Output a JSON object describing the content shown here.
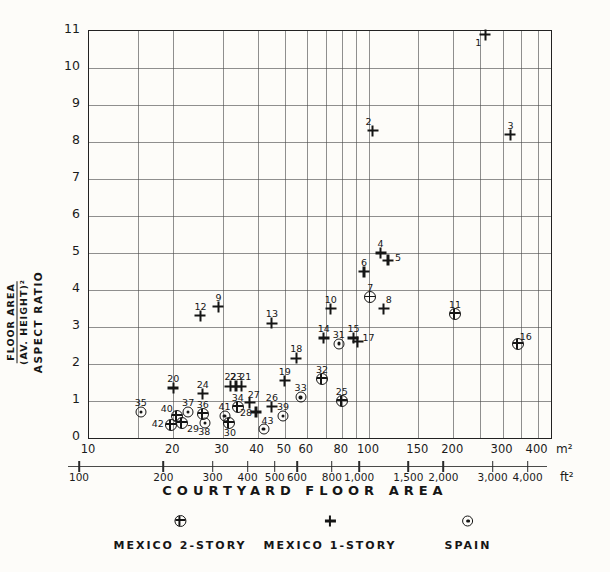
{
  "figure": {
    "paper_color": "#fdfcf9",
    "ink_color": "#1d1d1d"
  },
  "chart_data": {
    "type": "scatter",
    "title": "",
    "x_axis": {
      "label": "COURTYARD FLOOR AREA",
      "scale": "log",
      "unit_primary": "m²",
      "unit_secondary": "ft²",
      "ticks_m2": [
        10,
        20,
        30,
        40,
        50,
        60,
        80,
        100,
        150,
        200,
        300,
        400
      ],
      "tick_labels_m2": [
        "10",
        "20",
        "30",
        "40",
        "50",
        "60",
        "80",
        "100",
        "150",
        "200",
        "300",
        "400"
      ],
      "ticks_ft2": [
        100,
        200,
        300,
        400,
        500,
        600,
        800,
        1000,
        1500,
        2000,
        3000,
        4000
      ],
      "tick_labels_ft2": [
        "100",
        "200",
        "300",
        "400",
        "500",
        "600",
        "800",
        "1,000",
        "1,500",
        "2,000",
        "3,000",
        "4,000"
      ],
      "gridlines_m2": [
        15,
        20,
        30,
        40,
        50,
        60,
        70,
        80,
        90,
        100,
        150,
        200,
        250,
        300,
        350,
        400
      ],
      "xlim_m2": [
        10,
        450
      ]
    },
    "y_axis": {
      "label_lines": [
        "FLOOR AREA",
        "(AV. HEIGHT)²",
        "ASPECT RATIO"
      ],
      "ticks": [
        0,
        1,
        2,
        3,
        4,
        5,
        6,
        7,
        8,
        9,
        10,
        11
      ],
      "ylim": [
        0,
        11
      ],
      "grid": true
    },
    "series": [
      {
        "name": "MEXICO 2-STORY",
        "symbol": "circle-cross",
        "points": [
          {
            "n": "7",
            "m2": 101,
            "ratio": 3.8
          },
          {
            "n": "11",
            "m2": 203,
            "ratio": 3.35
          },
          {
            "n": "16",
            "m2": 340,
            "ratio": 2.55,
            "lx": 8,
            "ly": -7
          },
          {
            "n": "25",
            "m2": 80,
            "ratio": 1.0
          },
          {
            "n": "29",
            "m2": 21.5,
            "ratio": 0.4,
            "lx": 11,
            "ly": 6
          },
          {
            "n": "30",
            "m2": 31.6,
            "ratio": 0.4,
            "lx": 1,
            "ly": 10
          },
          {
            "n": "32",
            "m2": 68,
            "ratio": 1.6
          },
          {
            "n": "34",
            "m2": 34,
            "ratio": 0.85
          },
          {
            "n": "36",
            "m2": 25.5,
            "ratio": 0.65
          },
          {
            "n": "40",
            "m2": 20.6,
            "ratio": 0.6,
            "lx": -10,
            "ly": -7
          },
          {
            "n": "42",
            "m2": 19.6,
            "ratio": 0.35,
            "lx": -13,
            "ly": -1
          }
        ]
      },
      {
        "name": "MEXICO 1-STORY",
        "symbol": "plus",
        "points": [
          {
            "n": "1",
            "m2": 260,
            "ratio": 10.9,
            "lx": -7,
            "ly": 8
          },
          {
            "n": "2",
            "m2": 103,
            "ratio": 8.3,
            "lx": -4,
            "ly": -9
          },
          {
            "n": "3",
            "m2": 320,
            "ratio": 8.2
          },
          {
            "n": "4",
            "m2": 110,
            "ratio": 5.0
          },
          {
            "n": "5",
            "m2": 117,
            "ratio": 4.8,
            "lx": 10,
            "ly": -2
          },
          {
            "n": "6",
            "m2": 96,
            "ratio": 4.5
          },
          {
            "n": "8",
            "m2": 113,
            "ratio": 3.5,
            "lx": 5,
            "ly": -9
          },
          {
            "n": "9",
            "m2": 29,
            "ratio": 3.55
          },
          {
            "n": "10",
            "m2": 73,
            "ratio": 3.5
          },
          {
            "n": "12",
            "m2": 25,
            "ratio": 3.3
          },
          {
            "n": "13",
            "m2": 45,
            "ratio": 3.1
          },
          {
            "n": "14",
            "m2": 69,
            "ratio": 2.7
          },
          {
            "n": "15",
            "m2": 88,
            "ratio": 2.7
          },
          {
            "n": "17",
            "m2": 91,
            "ratio": 2.6,
            "lx": 11,
            "ly": -4
          },
          {
            "n": "18",
            "m2": 55,
            "ratio": 2.15
          },
          {
            "n": "19",
            "m2": 50,
            "ratio": 1.55
          },
          {
            "n": "20",
            "m2": 20,
            "ratio": 1.35
          },
          {
            "n": "21",
            "m2": 35,
            "ratio": 1.4,
            "lx": 4,
            "ly": -9
          },
          {
            "n": "22",
            "m2": 32,
            "ratio": 1.4
          },
          {
            "n": "23",
            "m2": 33.5,
            "ratio": 1.4
          },
          {
            "n": "24",
            "m2": 25.5,
            "ratio": 1.2
          },
          {
            "n": "26",
            "m2": 45,
            "ratio": 0.85
          },
          {
            "n": "27",
            "m2": 37.5,
            "ratio": 0.95,
            "lx": 4,
            "ly": -8
          },
          {
            "n": "28",
            "m2": 39.5,
            "ratio": 0.7,
            "lx": -10,
            "ly": 1
          }
        ]
      },
      {
        "name": "SPAIN",
        "symbol": "circle-dot",
        "points": [
          {
            "n": "31",
            "m2": 78,
            "ratio": 2.55
          },
          {
            "n": "33",
            "m2": 57,
            "ratio": 1.1
          },
          {
            "n": "35",
            "m2": 15.3,
            "ratio": 0.7
          },
          {
            "n": "37",
            "m2": 22.6,
            "ratio": 0.7
          },
          {
            "n": "38",
            "m2": 26,
            "ratio": 0.4,
            "lx": -1,
            "ly": 9
          },
          {
            "n": "39",
            "m2": 49.3,
            "ratio": 0.6
          },
          {
            "n": "41",
            "m2": 30.5,
            "ratio": 0.6
          },
          {
            "n": "43",
            "m2": 42,
            "ratio": 0.25,
            "lx": 4,
            "ly": -8
          }
        ]
      }
    ],
    "legend": [
      {
        "label": "MEXICO 2-STORY",
        "symbol": "circle-cross"
      },
      {
        "label": "MEXICO 1-STORY",
        "symbol": "plus"
      },
      {
        "label": "SPAIN",
        "symbol": "circle-dot"
      }
    ],
    "legend_position": "bottom"
  }
}
